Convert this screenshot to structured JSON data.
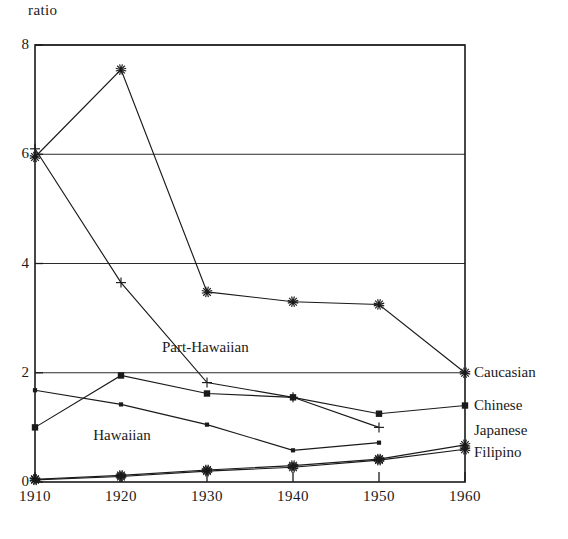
{
  "chart_data": {
    "type": "line",
    "title": "",
    "ylabel": "ratio",
    "xlabel": "",
    "x": [
      1910,
      1920,
      1930,
      1940,
      1950,
      1960
    ],
    "xticklabels": [
      "1910",
      "1920",
      "1930",
      "1940",
      "1950",
      "1960"
    ],
    "yticklabels": [
      "0",
      "2",
      "4",
      "6",
      "8"
    ],
    "yticks": [
      0,
      2,
      4,
      6,
      8
    ],
    "ylim": [
      0,
      8
    ],
    "xlim": [
      1910,
      1960
    ],
    "grid": "horizontal",
    "legend_position": "right-of-axes",
    "series": [
      {
        "name": "Caucasian",
        "marker": "star",
        "values": [
          5.95,
          7.55,
          3.48,
          3.3,
          3.25,
          2.0
        ]
      },
      {
        "name": "Chinese",
        "marker": "square",
        "values": [
          1.0,
          1.95,
          1.62,
          1.55,
          1.25,
          1.4
        ]
      },
      {
        "name": "Japanese",
        "marker": "star",
        "values": [
          0.05,
          0.12,
          0.22,
          0.3,
          0.42,
          0.68
        ]
      },
      {
        "name": "Filipino",
        "marker": "star",
        "values": [
          0.04,
          0.1,
          0.2,
          0.27,
          0.4,
          0.6
        ]
      },
      {
        "name": "Part-Hawaiian",
        "marker": "plus",
        "values": [
          6.1,
          3.65,
          1.82,
          1.55,
          1.0,
          null
        ]
      },
      {
        "name": "Hawaiian",
        "marker": "dot",
        "values": [
          1.68,
          1.42,
          1.05,
          0.58,
          0.72,
          null
        ]
      }
    ],
    "annotations": [
      {
        "text": "Part-Hawaiian",
        "x": 1930,
        "y": 2.45
      },
      {
        "text": "Hawaiian",
        "x": 1922,
        "y": 0.85
      }
    ],
    "legend_entries": [
      {
        "label": "Caucasian",
        "marker": "star"
      },
      {
        "label": "Chinese",
        "marker": "square"
      },
      {
        "label": "Japanese",
        "marker": "plus"
      },
      {
        "label": "Filipino",
        "marker": "star"
      }
    ]
  }
}
